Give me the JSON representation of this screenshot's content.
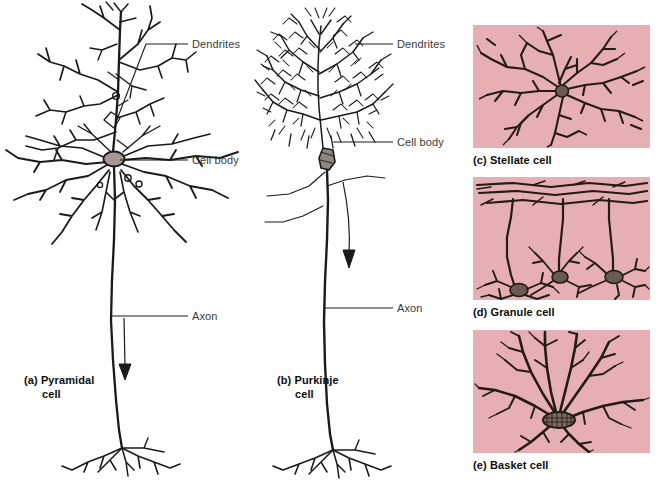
{
  "figure": {
    "title_visible": false,
    "background_color": "#fefefe",
    "ink_color": "#1a1a1a",
    "panel_background_color": "#e6afb4",
    "soma_fill_color": "#a39a96"
  },
  "annotations": {
    "pyramidal": {
      "dendrites_label": "Dendrites",
      "cell_body_label": "Cell body",
      "axon_label": "Axon",
      "caption_line1": "(a) Pyramidal",
      "caption_line2": "cell"
    },
    "purkinje": {
      "dendrites_label": "Dendrites",
      "cell_body_label": "Cell body",
      "axon_label": "Axon",
      "caption_line1": "(b) Purkinje",
      "caption_line2": "cell"
    },
    "stellate": {
      "caption": "(c) Stellate cell"
    },
    "granule": {
      "caption": "(d) Granule cell"
    },
    "basket": {
      "caption": "(e) Basket cell"
    }
  },
  "panels": [
    {
      "id": "stellate",
      "caption": "(c) Stellate cell",
      "x": 473,
      "y": 25,
      "w": 177,
      "h": 123
    },
    {
      "id": "granule",
      "caption": "(d) Granule cell",
      "x": 473,
      "y": 177,
      "w": 177,
      "h": 123
    },
    {
      "id": "basket",
      "caption": "(e) Basket cell",
      "x": 473,
      "y": 330,
      "w": 177,
      "h": 123
    }
  ]
}
